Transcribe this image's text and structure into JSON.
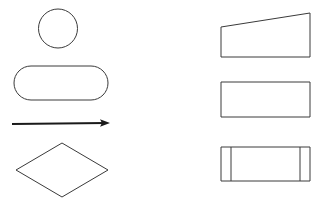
{
  "page": {
    "background_color": "#ffffff",
    "width": 328,
    "height": 203
  },
  "style": {
    "outline_color": "#3a3a3a",
    "outline_width": 1,
    "connector_color": "#1a1a1a",
    "connector_width": 2.2
  },
  "diagram": {
    "columns": [
      {
        "name": "left-column",
        "shapes": [
          {
            "id": "circle",
            "label": "Circle",
            "symbol_role": "connector-node",
            "geometry": {
              "cx": 58,
              "cy": 28.5,
              "r": 19.5
            }
          },
          {
            "id": "stadium",
            "label": "Rounded Rectangle",
            "symbol_role": "terminator",
            "geometry": {
              "x": 14,
              "y": 66,
              "width": 94,
              "height": 34,
              "rx": 17
            }
          },
          {
            "id": "arrow",
            "label": "Arrow",
            "symbol_role": "flow-connector",
            "geometry": {
              "x1": 12,
              "y1": 124,
              "x2": 108,
              "y2": 123,
              "head_size": 8
            }
          },
          {
            "id": "diamond",
            "label": "Diamond",
            "symbol_role": "decision",
            "geometry": {
              "points": "62,143 108,170 62,197 16,170"
            }
          }
        ]
      },
      {
        "name": "right-column",
        "shapes": [
          {
            "id": "trapezoid",
            "label": "Trapezoid",
            "symbol_role": "manual-operation",
            "geometry": {
              "points": "221,27 310,13 310,57 221,57"
            }
          },
          {
            "id": "rectangle",
            "label": "Rectangle",
            "symbol_role": "process",
            "geometry": {
              "x": 221,
              "y": 82,
              "width": 89,
              "height": 35
            }
          },
          {
            "id": "predefined-process",
            "label": "Predefined Process",
            "symbol_role": "subroutine",
            "geometry": {
              "x": 221,
              "y": 147,
              "width": 89,
              "height": 34,
              "inner_left_offset": 10,
              "inner_right_offset": 10
            }
          }
        ]
      }
    ]
  }
}
